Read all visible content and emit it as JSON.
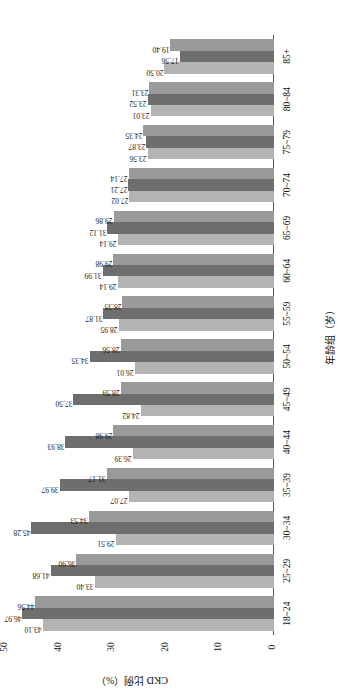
{
  "chart_data": {
    "type": "bar",
    "title": "",
    "xlabel": "年龄组（岁）",
    "ylabel": "CKD 比例（%）",
    "ylim": [
      0,
      50
    ],
    "yticks": [
      "0",
      "10",
      "20",
      "30",
      "40",
      "50"
    ],
    "grid": false,
    "legend": "none",
    "categories": [
      "18~24",
      "25~29",
      "30~34",
      "35~39",
      "40~44",
      "45~49",
      "50~54",
      "55~59",
      "60~64",
      "65~69",
      "70~74",
      "75~79",
      "80~84",
      "85+"
    ],
    "series": [
      {
        "name": "series-1",
        "color": "#b3b3b3",
        "values": [
          43.1,
          33.4,
          29.51,
          27.07,
          26.39,
          24.82,
          26.01,
          28.95,
          29.14,
          29.14,
          27.02,
          23.56,
          23.01,
          20.5
        ]
      },
      {
        "name": "series-2",
        "color": "#6e6e6e",
        "values": [
          46.97,
          41.68,
          45.28,
          39.97,
          38.93,
          37.5,
          34.35,
          31.87,
          31.99,
          31.12,
          27.21,
          23.87,
          23.52,
          17.56
        ]
      },
      {
        "name": "series-3",
        "color": "#9a9a9a",
        "values": [
          44.56,
          36.9,
          34.53,
          31.17,
          29.98,
          28.59,
          28.56,
          28.35,
          29.98,
          29.86,
          27.14,
          24.35,
          23.31,
          19.4
        ]
      }
    ],
    "value_labels": {
      "18~24": [
        "43.10",
        "46.97",
        "44.56"
      ],
      "25~29": [
        "33.40",
        "41.68",
        "36.90"
      ],
      "30~34": [
        "29.51",
        "45.28",
        "34.53"
      ],
      "35~39": [
        "27.07",
        "39.97",
        "31.17"
      ],
      "40~44": [
        "26.39",
        "38.93",
        "29.98"
      ],
      "45~49": [
        "24.82",
        "37.50",
        "28.59"
      ],
      "50~54": [
        "26.01",
        "34.35",
        "28.56"
      ],
      "55~59": [
        "28.95",
        "31.87",
        "28.35"
      ],
      "60~64": [
        "29.14",
        "31.99",
        "29.98"
      ],
      "65~69": [
        "29.14",
        "31.12",
        "29.86"
      ],
      "70~74": [
        "27.02",
        "27.21",
        "27.14"
      ],
      "75~79": [
        "23.56",
        "23.87",
        "24.35"
      ],
      "80~84": [
        "23.01",
        "23.52",
        "23.31"
      ],
      "85+": [
        "20.50",
        "17.56",
        "19.40"
      ]
    }
  }
}
